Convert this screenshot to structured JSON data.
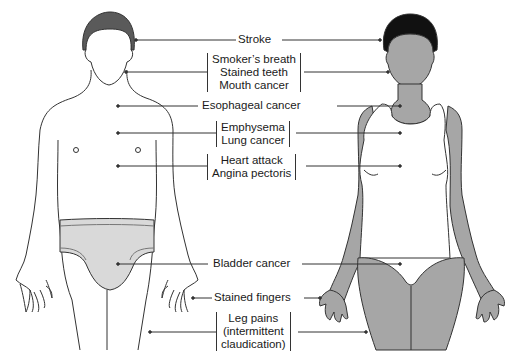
{
  "diagram": {
    "type": "annotated-illustration",
    "figures": [
      {
        "name": "male-figure",
        "style": "outline with gray underwear and dark hair"
      },
      {
        "name": "female-figure",
        "style": "gray filled body with white tank top, black hair"
      }
    ],
    "colors": {
      "line": "#333333",
      "gray_fill": "#a6a6a6",
      "light_gray": "#d9d9d9",
      "hair_dark": "#1a1a1a",
      "hair_male": "#5a5a5a"
    }
  },
  "labels": [
    {
      "id": "stroke",
      "lines": [
        "Stroke"
      ]
    },
    {
      "id": "mouth",
      "lines": [
        "Smoker’s breath",
        "Stained teeth",
        "Mouth cancer"
      ]
    },
    {
      "id": "esophageal",
      "lines": [
        "Esophageal cancer"
      ]
    },
    {
      "id": "lung",
      "lines": [
        "Emphysema",
        "Lung cancer"
      ]
    },
    {
      "id": "heart",
      "lines": [
        "Heart attack",
        "Angina pectoris"
      ]
    },
    {
      "id": "bladder",
      "lines": [
        "Bladder cancer"
      ]
    },
    {
      "id": "fingers",
      "lines": [
        "Stained fingers"
      ]
    },
    {
      "id": "legs",
      "lines": [
        "Leg pains",
        "(intermittent",
        "claudication)"
      ]
    }
  ]
}
